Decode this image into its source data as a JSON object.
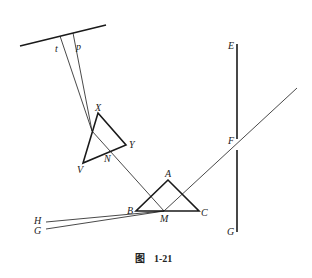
{
  "caption": {
    "prefix": "图",
    "number": "1-21"
  },
  "labels": {
    "t": "t",
    "p": "p",
    "X": "X",
    "Y": "Y",
    "V": "V",
    "N": "N",
    "A": "A",
    "B": "B",
    "C": "C",
    "M": "M",
    "H": "H",
    "G_left": "G",
    "E": "E",
    "F": "F",
    "G_right": "G"
  },
  "colors": {
    "line": "#1a1a1a",
    "background": "#ffffff"
  }
}
